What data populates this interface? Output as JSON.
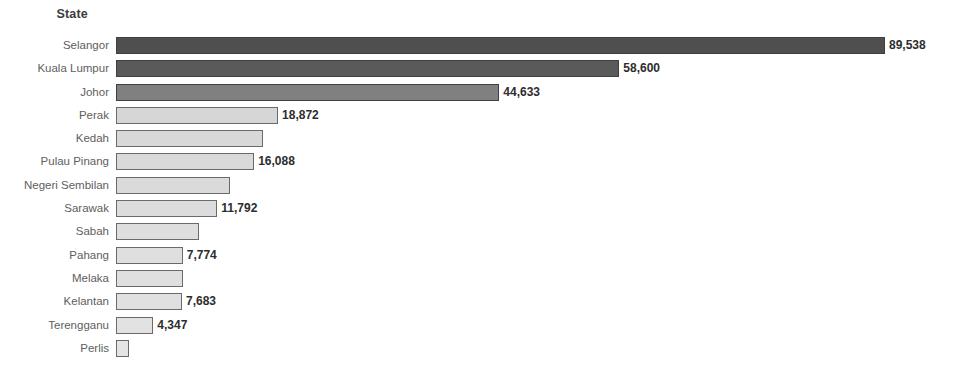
{
  "chart": {
    "axis_title": "State",
    "type": "bar"
  },
  "chart_data": {
    "type": "bar",
    "orientation": "horizontal",
    "title": "",
    "subtitle": "",
    "xlabel": "",
    "ylabel": "State",
    "axis_title": "State",
    "grid": false,
    "legend": false,
    "xlim": [
      0,
      89538
    ],
    "categories": [
      "Selangor",
      "Kuala Lumpur",
      "Johor",
      "Perak",
      "Kedah",
      "Pulau Pinang",
      "Negeri Sembilan",
      "Sarawak",
      "Sabah",
      "Pahang",
      "Melaka",
      "Kelantan",
      "Terengganu",
      "Perlis"
    ],
    "values": [
      89538,
      58600,
      44633,
      18872,
      17100,
      16088,
      13300,
      11792,
      9700,
      7774,
      7800,
      7683,
      4347,
      1500
    ],
    "labels": [
      "89,538",
      "58,600",
      "44,633",
      "18,872",
      "",
      "16,088",
      "",
      "11,792",
      "",
      "7,774",
      "",
      "7,683",
      "4,347",
      ""
    ],
    "bar_colors": [
      "#4f4f4f",
      "#5a5a5a",
      "#808080",
      "#d6d6d6",
      "#d8d8d8",
      "#d9d9d9",
      "#dadada",
      "#dcdcdc",
      "#dedede",
      "#dfdfdf",
      "#dfdfdf",
      "#e0e0e0",
      "#e2e2e2",
      "#e4e4e4"
    ],
    "accent_color": "#4f4f4f",
    "label_color": "#2d2d2d",
    "category_color": "#5e5e5e"
  }
}
